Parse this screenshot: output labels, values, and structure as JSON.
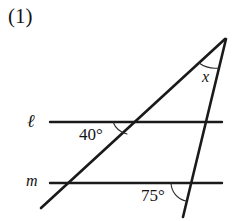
{
  "figure": {
    "problem_number": "(1)",
    "background_color": "#ffffff",
    "stroke_color": "#1a1a1a",
    "width": 247,
    "height": 221,
    "line_labels": {
      "parallel_upper": "ℓ",
      "parallel_lower": "m"
    },
    "angles": [
      {
        "id": "angle-40",
        "label": "40°",
        "value": 40,
        "unit": "degrees",
        "vertex": "intersection of line ℓ and diagonal transversal"
      },
      {
        "id": "angle-75",
        "label": "75°",
        "value": 75,
        "unit": "degrees",
        "vertex": "intersection of line m and steep transversal"
      },
      {
        "id": "angle-x",
        "label": "x",
        "value": null,
        "unit": "degrees",
        "vertex": "apex where the two transversals meet"
      }
    ],
    "geometry": {
      "line_l": {
        "x1": 50,
        "y1": 122,
        "x2": 222,
        "y2": 122
      },
      "line_m": {
        "x1": 50,
        "y1": 183,
        "x2": 222,
        "y2": 183
      },
      "transversal_diagonal": {
        "x1": 41,
        "y1": 208,
        "x2": 225,
        "y2": 39
      },
      "transversal_steep": {
        "x1": 226,
        "y1": 39,
        "x2": 183,
        "y2": 217
      }
    }
  }
}
